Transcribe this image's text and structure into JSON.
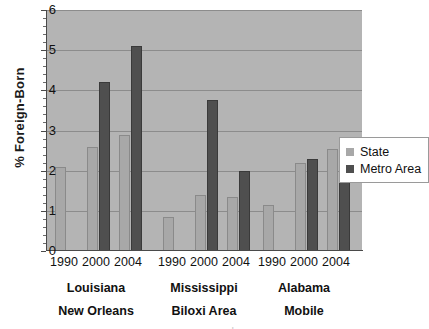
{
  "chart_data": {
    "type": "bar",
    "title": "",
    "xlabel": "",
    "ylabel": "% Foreign-Born",
    "ylim": [
      0,
      6
    ],
    "yticks": [
      0,
      1,
      2,
      3,
      4,
      5,
      6
    ],
    "grid": true,
    "legend_position": "right",
    "categories": [
      "1990",
      "2000",
      "2004",
      "1990",
      "2000",
      "2004",
      "1990",
      "2000",
      "2004"
    ],
    "groups": [
      {
        "state": "Louisiana",
        "metro": "New Orleans",
        "years": [
          "1990",
          "2000",
          "2004"
        ]
      },
      {
        "state": "Mississippi",
        "metro": "Biloxi Area",
        "years": [
          "1990",
          "2000",
          "2004"
        ]
      },
      {
        "state": "Alabama",
        "metro": "Mobile",
        "years": [
          "1990",
          "2000",
          "2004"
        ]
      }
    ],
    "series": [
      {
        "name": "State",
        "color": "#a8a8a8",
        "values": [
          2.1,
          2.6,
          2.9,
          0.85,
          1.4,
          1.35,
          1.15,
          2.2,
          2.55
        ]
      },
      {
        "name": "Metro Area",
        "color": "#4f4f4f",
        "values": [
          null,
          4.2,
          5.1,
          null,
          3.75,
          2.0,
          null,
          2.3,
          2.1
        ]
      }
    ]
  },
  "legend": {
    "items": [
      {
        "label": "State",
        "color": "#a8a8a8"
      },
      {
        "label": "Metro Area",
        "color": "#4f4f4f"
      }
    ]
  },
  "axis": {
    "y_title": "% Foreign-Born",
    "y_tick_labels": [
      "6",
      "5",
      "4",
      "3",
      "2",
      "1",
      "0"
    ]
  },
  "caption_sliver": "a o u r c e   u . s .   c e n s u s   b u r e a u"
}
